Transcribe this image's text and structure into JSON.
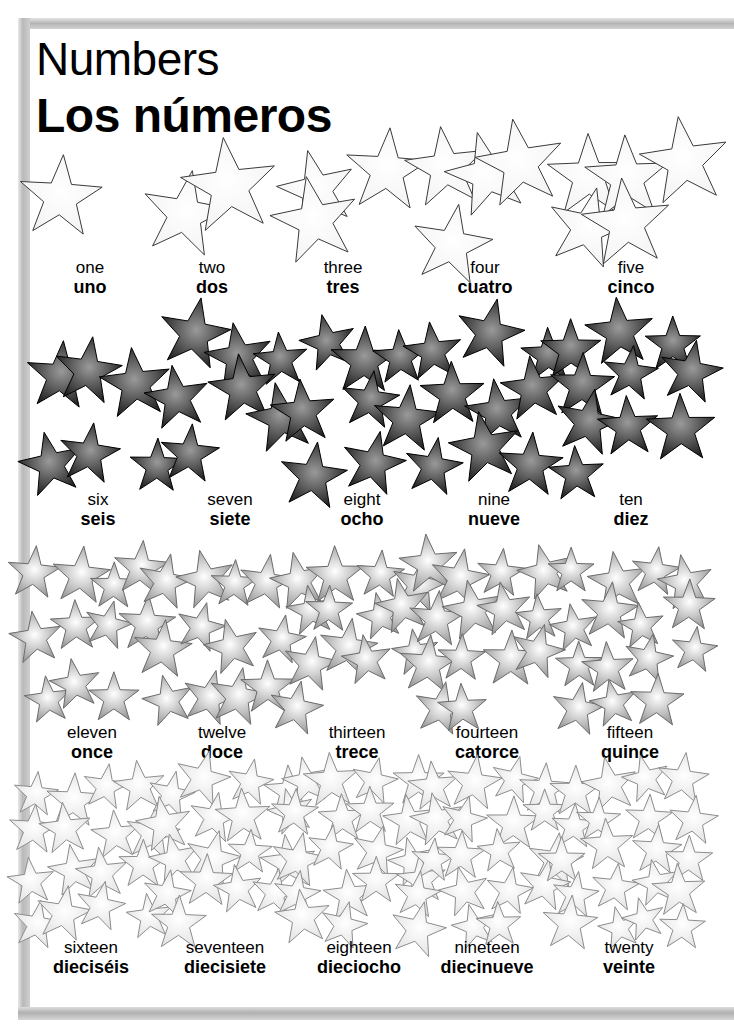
{
  "page": {
    "title_en": "Numbers",
    "title_es": "Los números",
    "border_color": "#b9b9b9",
    "background": "#ffffff"
  },
  "star_styles": {
    "row1": {
      "name": "outline-white-star",
      "fill": "#ffffff",
      "stroke": "#3a3a3a",
      "center": "#ffffff",
      "edge": "#f2f2f2"
    },
    "row2": {
      "name": "dark-gradient-star",
      "fill": "#1a1a1a",
      "stroke": "#000000",
      "center": "#9a9a9a",
      "edge": "#111111"
    },
    "row3": {
      "name": "gray-gradient-star",
      "fill": "#8c8c8c",
      "stroke": "#6b6b6b",
      "center": "#ffffff",
      "edge": "#8a8a8a"
    },
    "row4": {
      "name": "light-gradient-star",
      "fill": "#f6f6f6",
      "stroke": "#8d8d8d",
      "center": "#ffffff",
      "edge": "#e0e0e0"
    }
  },
  "chart_data": {
    "type": "table",
    "xlabel": "",
    "ylabel": "",
    "categories": [
      "one",
      "two",
      "three",
      "four",
      "five",
      "six",
      "seven",
      "eight",
      "nine",
      "ten",
      "eleven",
      "twelve",
      "thirteen",
      "fourteen",
      "fifteen",
      "sixteen",
      "seventeen",
      "eighteen",
      "nineteen",
      "twenty"
    ],
    "values": [
      1,
      2,
      3,
      4,
      5,
      6,
      7,
      8,
      9,
      10,
      11,
      12,
      13,
      14,
      15,
      16,
      17,
      18,
      19,
      20
    ],
    "series": [
      {
        "name": "english",
        "values": [
          "one",
          "two",
          "three",
          "four",
          "five",
          "six",
          "seven",
          "eight",
          "nine",
          "ten",
          "eleven",
          "twelve",
          "thirteen",
          "fourteen",
          "fifteen",
          "sixteen",
          "seventeen",
          "eighteen",
          "nineteen",
          "twenty"
        ]
      },
      {
        "name": "spanish",
        "values": [
          "uno",
          "dos",
          "tres",
          "cuatro",
          "cinco",
          "seis",
          "siete",
          "ocho",
          "nueve",
          "diez",
          "once",
          "doce",
          "trece",
          "catorce",
          "quince",
          "dieciséis",
          "diecisiete",
          "dieciocho",
          "diecinueve",
          "veinte"
        ]
      },
      {
        "name": "star_count",
        "values": [
          1,
          2,
          3,
          4,
          5,
          6,
          7,
          8,
          9,
          10,
          11,
          12,
          13,
          14,
          15,
          16,
          17,
          18,
          19,
          20
        ]
      }
    ]
  },
  "rows": [
    {
      "index": 0,
      "top": 140,
      "label_top": 118,
      "star_style": "row1",
      "cells": [
        {
          "number": 1,
          "en": "one",
          "es": "uno",
          "count": 1,
          "left": 30,
          "width": 120
        },
        {
          "number": 2,
          "en": "two",
          "es": "dos",
          "count": 2,
          "left": 152,
          "width": 120
        },
        {
          "number": 3,
          "en": "three",
          "es": "tres",
          "count": 3,
          "left": 280,
          "width": 126
        },
        {
          "number": 4,
          "en": "four",
          "es": "cuatro",
          "count": 4,
          "left": 418,
          "width": 134
        },
        {
          "number": 5,
          "en": "five",
          "es": "cinco",
          "count": 5,
          "left": 556,
          "width": 150
        }
      ]
    },
    {
      "index": 1,
      "top": 310,
      "label_top": 180,
      "star_style": "row2",
      "cells": [
        {
          "number": 6,
          "en": "six",
          "es": "seis",
          "count": 6,
          "left": 28,
          "width": 140
        },
        {
          "number": 7,
          "en": "seven",
          "es": "siete",
          "count": 7,
          "left": 160,
          "width": 140
        },
        {
          "number": 8,
          "en": "eight",
          "es": "ocho",
          "count": 8,
          "left": 292,
          "width": 140
        },
        {
          "number": 9,
          "en": "nine",
          "es": "nueve",
          "count": 9,
          "left": 420,
          "width": 148
        },
        {
          "number": 10,
          "en": "ten",
          "es": "diez",
          "count": 10,
          "left": 556,
          "width": 150
        }
      ]
    },
    {
      "index": 2,
      "top": 545,
      "label_top": 178,
      "star_style": "row3",
      "cells": [
        {
          "number": 11,
          "en": "eleven",
          "es": "once",
          "count": 11,
          "left": 22,
          "width": 140
        },
        {
          "number": 12,
          "en": "twelve",
          "es": "doce",
          "count": 12,
          "left": 152,
          "width": 140
        },
        {
          "number": 13,
          "en": "thirteen",
          "es": "trece",
          "count": 13,
          "left": 284,
          "width": 146
        },
        {
          "number": 14,
          "en": "fourteen",
          "es": "catorce",
          "count": 14,
          "left": 412,
          "width": 150
        },
        {
          "number": 15,
          "en": "fifteen",
          "es": "quince",
          "count": 15,
          "left": 552,
          "width": 156
        }
      ]
    },
    {
      "index": 3,
      "top": 762,
      "label_top": 176,
      "star_style": "row4",
      "cells": [
        {
          "number": 16,
          "en": "sixteen",
          "es": "dieciséis",
          "count": 16,
          "left": 16,
          "width": 150
        },
        {
          "number": 17,
          "en": "seventeen",
          "es": "diecisiete",
          "count": 17,
          "left": 150,
          "width": 150
        },
        {
          "number": 18,
          "en": "eighteen",
          "es": "dieciocho",
          "count": 18,
          "left": 284,
          "width": 150
        },
        {
          "number": 19,
          "en": "nineteen",
          "es": "diecinueve",
          "count": 19,
          "left": 408,
          "width": 158
        },
        {
          "number": 20,
          "en": "twenty",
          "es": "veinte",
          "count": 20,
          "left": 548,
          "width": 162
        }
      ]
    }
  ]
}
